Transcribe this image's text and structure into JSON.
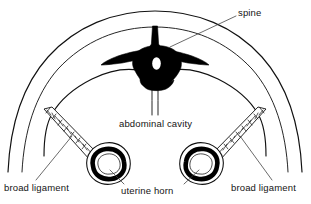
{
  "figure": {
    "background_color": "#ffffff",
    "ink_color": "#111111",
    "leader_color": "#3a3a3a"
  },
  "labels": {
    "spine": "spine",
    "abdominal_cavity": "abdominal cavity",
    "broad_ligament_left": "broad ligament",
    "uterine_horn": "uterine horn",
    "broad_ligament_right": "broad ligament"
  },
  "structures": {
    "body_wall": "body-wall-outline",
    "peritoneum": "peritoneal-lining",
    "vertebra": "vertebra-silhouette",
    "spinal_canal": "spinal-canal",
    "midline_septum": "midline-septum",
    "uterine_horn_left": "uterine-horn-left",
    "uterine_horn_right": "uterine-horn-right",
    "broad_ligament_left": "broad-ligament-left",
    "broad_ligament_right": "broad-ligament-right"
  }
}
